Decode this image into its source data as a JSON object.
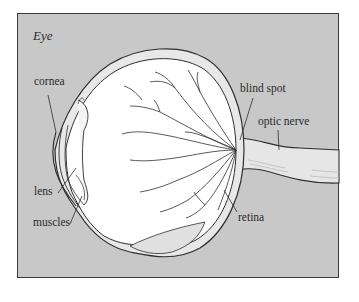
{
  "diagram": {
    "title": "Eye",
    "labels": {
      "cornea": "cornea",
      "lens": "lens",
      "muscles": "muscles",
      "blind_spot": "blind spot",
      "optic_nerve": "optic nerve",
      "retina": "retina"
    },
    "colors": {
      "background": "#c8c8c8",
      "frame_border": "#3a3a3a",
      "eyeball": "#ffffff",
      "outline": "#2f2f2f",
      "shading": "#e2e2e2"
    }
  }
}
